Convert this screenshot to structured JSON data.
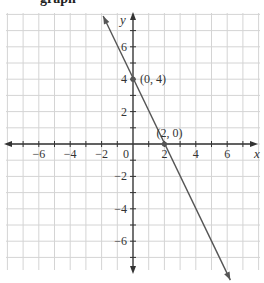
{
  "header": {
    "title_fragment": "graph"
  },
  "chart_data": {
    "type": "line",
    "title": "",
    "xlabel": "x",
    "ylabel": "y",
    "xlim": [
      -8,
      8
    ],
    "ylim": [
      -8,
      8
    ],
    "grid": true,
    "x_ticks": [
      -6,
      -4,
      -2,
      0,
      2,
      4,
      6
    ],
    "y_ticks": [
      -6,
      -4,
      -2,
      2,
      4,
      6
    ],
    "x_tick_labels": [
      "−6",
      "−4",
      "−2",
      "0",
      "2",
      "4",
      "6"
    ],
    "y_tick_labels": [
      "−6",
      "−4",
      "−2",
      "2",
      "4",
      "6"
    ],
    "series": [
      {
        "name": "y = -2x + 4",
        "equation": "y = -2x + 4",
        "x": [
          -1.9,
          6.2
        ],
        "y": [
          7.9,
          -8.4
        ],
        "arrows": "both"
      }
    ],
    "points": [
      {
        "x": 0,
        "y": 4,
        "label": "(0, 4)"
      },
      {
        "x": 2,
        "y": 0,
        "label": "(2, 0)"
      }
    ]
  },
  "colors": {
    "grid": "#d4d4d4",
    "axis": "#333333",
    "line": "#555555",
    "point": "#555555"
  }
}
